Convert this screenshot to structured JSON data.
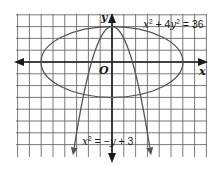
{
  "diagram": {
    "type": "coordinate-plane-graph",
    "axes": {
      "x_label": "x",
      "y_label": "y",
      "origin_label": "O"
    },
    "curves": [
      {
        "name": "ellipse",
        "equation": "x² + 4y² = 36",
        "label_parts": {
          "var1": "x",
          "exp1": "2",
          "op1": " + 4",
          "var2": "y",
          "exp2": "2",
          "op2": " = 36"
        },
        "semi_major_x": 6,
        "semi_minor_y": 3
      },
      {
        "name": "parabola",
        "equation": "x² = −y + 3",
        "label_parts": {
          "var1": "x",
          "exp1": "2",
          "op1": " = −",
          "var2": "y",
          "op2": " + 3"
        },
        "vertex": [
          0,
          3
        ],
        "opens": "down"
      }
    ],
    "grid": {
      "unit_px": 11.8,
      "x_range": [
        -8,
        8
      ],
      "y_range": [
        -7,
        4
      ]
    },
    "colors": {
      "grid": "#6a6a6a",
      "axis": "#1a1a1a",
      "curve": "#555555"
    }
  }
}
